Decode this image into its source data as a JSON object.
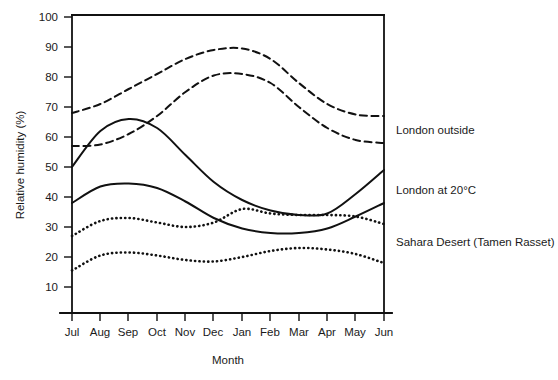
{
  "chart_data": {
    "type": "line",
    "title": "",
    "xlabel": "Month",
    "ylabel": "Relative humidity (%)",
    "categories": [
      "Jul",
      "Aug",
      "Sep",
      "Oct",
      "Nov",
      "Dec",
      "Jan",
      "Feb",
      "Mar",
      "Apr",
      "May",
      "Jun"
    ],
    "xlim": [
      "Jul",
      "Jun"
    ],
    "ylim": [
      0,
      100
    ],
    "yticks": [
      10,
      20,
      30,
      40,
      50,
      60,
      70,
      80,
      90,
      100
    ],
    "ytick_labels": [
      "10",
      "20",
      "30",
      "40",
      "50",
      "60",
      "70",
      "80",
      "90",
      "100"
    ],
    "grid": false,
    "legend_position": "right-inline",
    "series": [
      {
        "name": "London outside (upper)",
        "label": "London outside",
        "style": "dashed",
        "values": [
          68,
          71,
          76,
          81,
          86,
          89,
          89.5,
          86,
          78,
          71,
          67.5,
          67
        ]
      },
      {
        "name": "London outside (lower)",
        "label": "London outside",
        "style": "dashed",
        "values": [
          57,
          57.5,
          61,
          67,
          75,
          80.5,
          81,
          78,
          70,
          63,
          59,
          58
        ]
      },
      {
        "name": "London at 20°C (upper)",
        "label": "London at 20°C",
        "style": "solid",
        "values": [
          50,
          62,
          66,
          63,
          54,
          45,
          39,
          35.5,
          34,
          34.5,
          41,
          49
        ]
      },
      {
        "name": "London at 20°C (lower)",
        "label": "London at 20°C",
        "style": "solid",
        "values": [
          38,
          43.5,
          44.5,
          43,
          38.5,
          33,
          29.5,
          28,
          28,
          29.5,
          33.5,
          38
        ]
      },
      {
        "name": "Sahara Desert (Tamen Rasset) (upper)",
        "label": "Sahara Desert (Tamen Rasset)",
        "style": "dotted",
        "values": [
          27,
          32,
          33,
          31.5,
          30,
          31.5,
          36,
          34.5,
          34,
          34,
          33.5,
          31
        ]
      },
      {
        "name": "Sahara Desert (Tamen Rasset) (lower)",
        "label": "Sahara Desert (Tamen Rasset)",
        "style": "dotted",
        "values": [
          15.5,
          20.5,
          21.5,
          20.5,
          19,
          18.5,
          20,
          22,
          23,
          22.5,
          21,
          18
        ]
      }
    ],
    "annotations": [
      {
        "id": "label-london-outside",
        "text": "London outside",
        "value": 63
      },
      {
        "id": "label-london-20c",
        "text": "London at 20°C",
        "value": 43
      },
      {
        "id": "label-sahara",
        "text": "Sahara Desert (Tamen Rasset)",
        "value": 25
      }
    ]
  },
  "axis": {
    "ylabel": "Relative humidity (%)",
    "xlabel": "Month",
    "ytick_labels": [
      "100",
      "90",
      "80",
      "70",
      "60",
      "50",
      "40",
      "30",
      "20",
      "10"
    ],
    "xtick_labels": [
      "Jul",
      "Aug",
      "Sep",
      "Oct",
      "Nov",
      "Dec",
      "Jan",
      "Feb",
      "Mar",
      "Apr",
      "May",
      "Jun"
    ]
  },
  "labels": {
    "london_outside": "London outside",
    "london_at_20c": "London at 20°C",
    "sahara": "Sahara Desert (Tamen Rasset)"
  },
  "colors": {
    "ink": "#111111",
    "background": "#ffffff"
  }
}
